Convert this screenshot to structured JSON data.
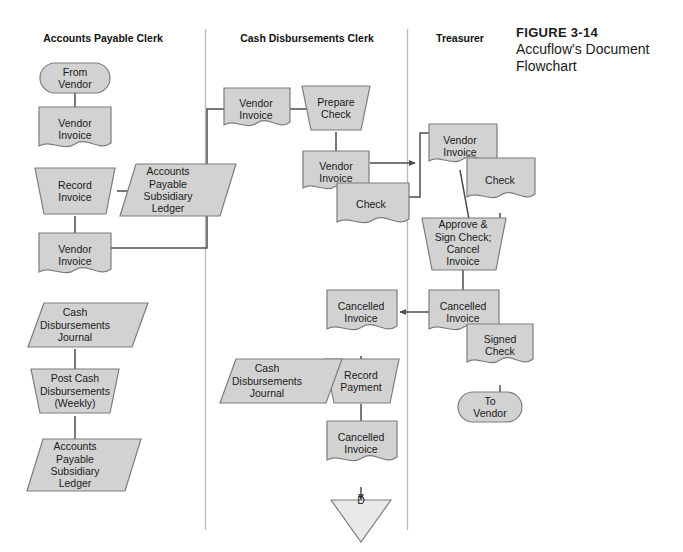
{
  "figure": {
    "number": "FIGURE 3-14",
    "title": "Accuflow's Document Flowchart"
  },
  "columns": [
    {
      "id": "accounts-payable-clerk",
      "header": "Accounts Payable Clerk"
    },
    {
      "id": "cash-disbursements-clerk",
      "header": "Cash Disbursements Clerk"
    },
    {
      "id": "treasurer",
      "header": "Treasurer"
    }
  ],
  "colors": {
    "shape_fill": "#d2d2d2",
    "shape_fill_light": "#e9e9e9",
    "shape_stroke": "#7d7d7d",
    "connector": "#4d4d4d",
    "divider": "#bdbdbd",
    "text": "#1a1a1a",
    "page": "#ffffff"
  },
  "chart_data": {
    "type": "diagram",
    "title": "Accuflow's Document Flowchart",
    "diagram_kind": "document-flowchart",
    "swimlanes": [
      "Accounts Payable Clerk",
      "Cash Disbursements Clerk",
      "Treasurer"
    ],
    "nodes": [
      {
        "id": "n1",
        "lane": "Accounts Payable Clerk",
        "shape": "terminator",
        "label": "From\nVendor",
        "x": 75,
        "y": 78,
        "w": 70,
        "h": 30
      },
      {
        "id": "n2",
        "lane": "Accounts Payable Clerk",
        "shape": "document",
        "label": "Vendor\nInvoice",
        "x": 75,
        "y": 129,
        "w": 72,
        "h": 44
      },
      {
        "id": "n3",
        "lane": "Accounts Payable Clerk",
        "shape": "manual-process",
        "label": "Record\nInvoice",
        "x": 75,
        "y": 191,
        "w": 80,
        "h": 46
      },
      {
        "id": "n4",
        "lane": "Accounts Payable Clerk",
        "shape": "parallelogram",
        "label": "Accounts\nPayable\nSubsidiary\nLedger",
        "x": 168,
        "y": 190,
        "w": 84,
        "h": 52
      },
      {
        "id": "n5",
        "lane": "Accounts Payable Clerk",
        "shape": "document",
        "label": "Vendor\nInvoice",
        "x": 75,
        "y": 255,
        "w": 72,
        "h": 44
      },
      {
        "id": "n6",
        "lane": "Accounts Payable Clerk",
        "shape": "parallelogram",
        "label": "Cash\nDisbursements\nJournal",
        "x": 75,
        "y": 325,
        "w": 90,
        "h": 44
      },
      {
        "id": "n7",
        "lane": "Accounts Payable Clerk",
        "shape": "manual-process",
        "label": "Post Cash\nDisbursements\n(Weekly)",
        "x": 75,
        "y": 391,
        "w": 88,
        "h": 46
      },
      {
        "id": "n8",
        "lane": "Accounts Payable Clerk",
        "shape": "parallelogram",
        "label": "Accounts\nPayable\nSubsidiary\nLedger",
        "x": 75,
        "y": 465,
        "w": 84,
        "h": 52
      },
      {
        "id": "n9",
        "lane": "Cash Disbursements Clerk",
        "shape": "document",
        "label": "Vendor\nInvoice",
        "x": 256,
        "y": 109,
        "w": 66,
        "h": 42
      },
      {
        "id": "n10",
        "lane": "Cash Disbursements Clerk",
        "shape": "manual-process",
        "label": "Prepare\nCheck",
        "x": 336,
        "y": 108,
        "w": 68,
        "h": 44
      },
      {
        "id": "n11",
        "lane": "Cash Disbursements Clerk",
        "shape": "document",
        "label": "Vendor\nInvoice",
        "x": 336,
        "y": 172,
        "w": 66,
        "h": 42
      },
      {
        "id": "n12",
        "lane": "Cash Disbursements Clerk",
        "shape": "document",
        "label": "Check",
        "x": 371,
        "y": 204,
        "w": 72,
        "h": 42
      },
      {
        "id": "n13",
        "lane": "Cash Disbursements Clerk",
        "shape": "document",
        "label": "Cancelled\nInvoice",
        "x": 361,
        "y": 312,
        "w": 72,
        "h": 44
      },
      {
        "id": "n14",
        "lane": "Cash Disbursements Clerk",
        "shape": "manual-process",
        "label": "Record\nPayment",
        "x": 361,
        "y": 381,
        "w": 74,
        "h": 44
      },
      {
        "id": "n15",
        "lane": "Cash Disbursements Clerk",
        "shape": "parallelogram",
        "label": "Cash\nDisbursements\nJournal",
        "x": 267,
        "y": 381,
        "w": 92,
        "h": 44
      },
      {
        "id": "n16",
        "lane": "Cash Disbursements Clerk",
        "shape": "document",
        "label": "Cancelled\nInvoice",
        "x": 361,
        "y": 443,
        "w": 72,
        "h": 44
      },
      {
        "id": "n17",
        "lane": "Cash Disbursements Clerk",
        "shape": "connector-down",
        "label": "D",
        "x": 361,
        "y": 500,
        "w": 60,
        "h": 42
      },
      {
        "id": "n18",
        "lane": "Treasurer",
        "shape": "document",
        "label": "Vendor\nInvoice",
        "x": 460,
        "y": 146,
        "w": 68,
        "h": 44
      },
      {
        "id": "n19",
        "lane": "Treasurer",
        "shape": "document",
        "label": "Check",
        "x": 500,
        "y": 180,
        "w": 68,
        "h": 44
      },
      {
        "id": "n20",
        "lane": "Treasurer",
        "shape": "manual-process",
        "label": "Approve &\nSign Check;\nCancel\nInvoice",
        "x": 463,
        "y": 243,
        "w": 84,
        "h": 52
      },
      {
        "id": "n21",
        "lane": "Treasurer",
        "shape": "document",
        "label": "Cancelled\nInvoice",
        "x": 463,
        "y": 312,
        "w": 70,
        "h": 44
      },
      {
        "id": "n22",
        "lane": "Treasurer",
        "shape": "document",
        "label": "Signed\nCheck",
        "x": 500,
        "y": 345,
        "w": 66,
        "h": 44
      },
      {
        "id": "n23",
        "lane": "Treasurer",
        "shape": "terminator",
        "label": "To\nVendor",
        "x": 490,
        "y": 407,
        "w": 64,
        "h": 30
      }
    ],
    "edges": [
      {
        "from": "n1",
        "to": "n2",
        "kind": "vertical"
      },
      {
        "from": "n2",
        "to": "n3",
        "kind": "vertical"
      },
      {
        "from": "n3",
        "to": "n4",
        "kind": "horizontal"
      },
      {
        "from": "n3",
        "to": "n5",
        "kind": "vertical"
      },
      {
        "from": "n5",
        "to": "n9",
        "kind": "routed-up-right",
        "note": "crosses into Cash Disbursements Clerk lane"
      },
      {
        "from": "n9",
        "to": "n10",
        "kind": "horizontal"
      },
      {
        "from": "n10",
        "to": "n11",
        "kind": "vertical"
      },
      {
        "from": "n11",
        "to": "n18",
        "kind": "horizontal",
        "note": "crosses into Treasurer lane"
      },
      {
        "from": "n12",
        "to": "n18",
        "kind": "routed-right-up",
        "note": "crosses into Treasurer lane"
      },
      {
        "from": "n18",
        "to": "n20",
        "kind": "vertical"
      },
      {
        "from": "n19",
        "to": "n20",
        "kind": "vertical"
      },
      {
        "from": "n20",
        "to": "n21",
        "kind": "vertical"
      },
      {
        "from": "n21",
        "to": "n13",
        "kind": "horizontal-left",
        "note": "back to Cash Disbursements Clerk lane"
      },
      {
        "from": "n22",
        "to": "n23",
        "kind": "vertical"
      },
      {
        "from": "n13",
        "to": "n14",
        "kind": "vertical"
      },
      {
        "from": "n14",
        "to": "n15",
        "kind": "horizontal-left"
      },
      {
        "from": "n14",
        "to": "n16",
        "kind": "vertical"
      },
      {
        "from": "n16",
        "to": "n17",
        "kind": "vertical"
      },
      {
        "from": "n6",
        "to": "n7",
        "kind": "vertical"
      },
      {
        "from": "n7",
        "to": "n8",
        "kind": "vertical"
      }
    ]
  }
}
